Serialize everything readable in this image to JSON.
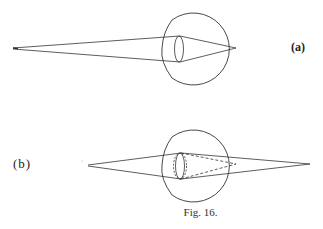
{
  "figure": {
    "caption": "Fig. 16.",
    "panels": [
      {
        "id": "a",
        "label": "(a)",
        "description": "Eye focusing rays from distant point onto retina; rays converge at retina"
      },
      {
        "id": "b",
        "label": "(b)",
        "description": "Eye with accommodated lens (dashed); near point rays converge behind retina (solid), dashed rays converge on retina"
      }
    ]
  },
  "colors": {
    "line": "#333333",
    "background": "#ffffff"
  }
}
